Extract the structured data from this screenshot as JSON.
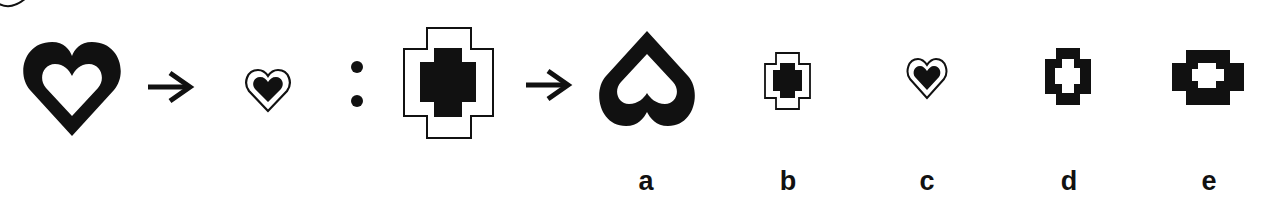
{
  "puzzle": {
    "type": "figure analogy",
    "question_badge": "",
    "analogy": {
      "first_term": "large-black-heart-with-white-heart-hole",
      "first_result": "small-outlined-heart-with-black-inner-heart",
      "separator": ":",
      "second_term": "stepped-cross-outline-with-black-inner-cross",
      "arrow": "→"
    },
    "options": [
      {
        "label": "a",
        "figure": "inverted-black-heart-with-white-hole"
      },
      {
        "label": "b",
        "figure": "small-stepped-cross-outline-with-black-inner-cross"
      },
      {
        "label": "c",
        "figure": "small-outlined-heart-with-black-inner-heart"
      },
      {
        "label": "d",
        "figure": "black-stepped-cross-with-white-cross-hole"
      },
      {
        "label": "e",
        "figure": "wide-black-stepped-cross-with-white-hole"
      }
    ],
    "colors": {
      "ink": "#111111",
      "background": "#ffffff"
    }
  }
}
